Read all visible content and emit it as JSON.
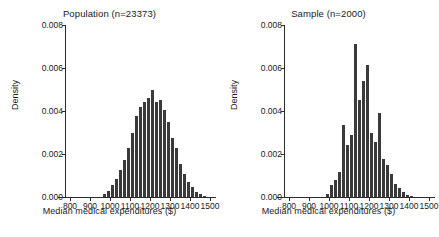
{
  "figure": {
    "panels": [
      {
        "key": "population",
        "title": "Population (n=23373)",
        "xlabel": "Median medical expenditures ($)",
        "ylabel": "Density"
      },
      {
        "key": "sample",
        "title": "Sample (n=2000)",
        "xlabel": "Median medical expenditures ($)",
        "ylabel": "Density"
      }
    ],
    "bar_color": "#3a3a3a",
    "axis_color": "#2b2b2b",
    "background": "#ffffff"
  },
  "chart_data": [
    {
      "type": "bar",
      "subtype": "histogram",
      "title": "Population (n=23373)",
      "xlabel": "Median medical expenditures ($)",
      "ylabel": "Density",
      "xlim": [
        780,
        1520
      ],
      "ylim": [
        0,
        0.008
      ],
      "xticks": [
        800,
        900,
        1000,
        1100,
        1200,
        1300,
        1400,
        1500
      ],
      "yticks": [
        0.0,
        0.002,
        0.004,
        0.006,
        0.008
      ],
      "ytick_labels": [
        "0.000",
        "0.002",
        "0.004",
        "0.006",
        "0.008"
      ],
      "grid": false,
      "legend": "none",
      "bin_width": 20,
      "bin_starts": [
        960,
        980,
        1000,
        1020,
        1040,
        1060,
        1080,
        1100,
        1120,
        1140,
        1160,
        1180,
        1200,
        1220,
        1240,
        1260,
        1280,
        1300,
        1320,
        1340,
        1360,
        1380,
        1400,
        1420,
        1440,
        1460
      ],
      "values": [
        0.00012,
        0.0003,
        0.00055,
        0.00085,
        0.00125,
        0.0017,
        0.0023,
        0.003,
        0.00375,
        0.0042,
        0.0044,
        0.0046,
        0.005,
        0.0044,
        0.0045,
        0.00405,
        0.0035,
        0.00275,
        0.0023,
        0.00155,
        0.00105,
        0.0007,
        0.00045,
        0.00025,
        0.00012,
        5e-05
      ]
    },
    {
      "type": "bar",
      "subtype": "histogram",
      "title": "Sample (n=2000)",
      "xlabel": "Median medical expenditures ($)",
      "ylabel": "Density",
      "xlim": [
        780,
        1520
      ],
      "ylim": [
        0,
        0.008
      ],
      "xticks": [
        800,
        900,
        1000,
        1100,
        1200,
        1300,
        1400,
        1500
      ],
      "yticks": [
        0.0,
        0.002,
        0.004,
        0.006,
        0.008
      ],
      "ytick_labels": [
        "0.000",
        "0.002",
        "0.004",
        "0.006",
        "0.008"
      ],
      "grid": false,
      "legend": "none",
      "bin_width": 20,
      "bin_starts": [
        980,
        1000,
        1020,
        1040,
        1060,
        1080,
        1100,
        1120,
        1140,
        1160,
        1180,
        1200,
        1220,
        1240,
        1260,
        1280,
        1300,
        1320,
        1340,
        1360,
        1380,
        1400
      ],
      "values": [
        0.00015,
        0.00055,
        0.0008,
        0.00115,
        0.00335,
        0.0024,
        0.0029,
        0.0071,
        0.0045,
        0.0054,
        0.00615,
        0.003,
        0.00255,
        0.0039,
        0.00175,
        0.0015,
        0.00105,
        0.0006,
        0.0004,
        0.00025,
        0.0001,
        4e-05
      ]
    }
  ]
}
